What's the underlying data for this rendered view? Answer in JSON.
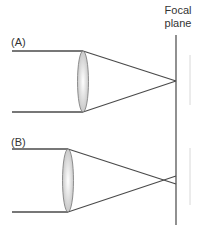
{
  "focal_plane": {
    "line1": "Focal",
    "line2": "plane"
  },
  "panels": [
    {
      "label": "(A)",
      "description": "Parallel rays focused exactly on the focal plane"
    },
    {
      "label": "(B)",
      "description": "Parallel rays focused in front of the focal plane, diverging past it"
    }
  ],
  "colors": {
    "ray": "#4a4a4a",
    "lens_fill": "#dcdcdc",
    "lens_stroke": "#777777",
    "plane": "#555555",
    "ghost": "#d8d8d8"
  }
}
